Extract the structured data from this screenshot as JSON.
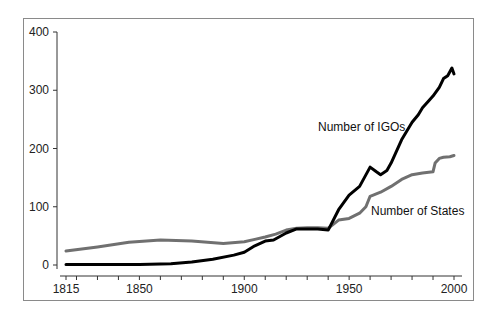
{
  "chart_data": {
    "type": "line",
    "title": "",
    "xlabel": "",
    "ylabel": "",
    "xlim": [
      1815,
      2002
    ],
    "ylim": [
      0,
      400
    ],
    "x_ticks": [
      1815,
      1850,
      1900,
      1950,
      2000
    ],
    "x_minor_tick_step": 10,
    "y_ticks": [
      0,
      100,
      200,
      300,
      400
    ],
    "grid": false,
    "legend_position": "inline annotations",
    "series": [
      {
        "name": "Number of IGOs",
        "color": "#000000",
        "x": [
          1815,
          1830,
          1850,
          1865,
          1875,
          1885,
          1895,
          1900,
          1905,
          1910,
          1914,
          1920,
          1925,
          1930,
          1935,
          1940,
          1945,
          1950,
          1955,
          1960,
          1963,
          1965,
          1968,
          1970,
          1975,
          1980,
          1983,
          1985,
          1988,
          1990,
          1993,
          1995,
          1997,
          1999,
          2000
        ],
        "values": [
          1,
          1,
          1,
          2,
          5,
          10,
          17,
          22,
          33,
          41,
          43,
          55,
          62,
          62,
          62,
          60,
          95,
          120,
          135,
          168,
          160,
          155,
          162,
          175,
          215,
          245,
          258,
          270,
          282,
          290,
          305,
          320,
          325,
          338,
          328
        ]
      },
      {
        "name": "Number of States",
        "color": "#707070",
        "x": [
          1815,
          1830,
          1845,
          1860,
          1875,
          1890,
          1900,
          1905,
          1910,
          1915,
          1920,
          1925,
          1930,
          1935,
          1940,
          1945,
          1950,
          1955,
          1958,
          1960,
          1965,
          1970,
          1975,
          1980,
          1985,
          1990,
          1991,
          1993,
          1995,
          1998,
          2000
        ],
        "values": [
          24,
          31,
          39,
          43,
          41,
          37,
          40,
          44,
          48,
          53,
          60,
          63,
          64,
          64,
          63,
          77,
          80,
          89,
          100,
          118,
          125,
          135,
          147,
          155,
          158,
          160,
          175,
          183,
          185,
          186,
          188
        ]
      }
    ]
  }
}
